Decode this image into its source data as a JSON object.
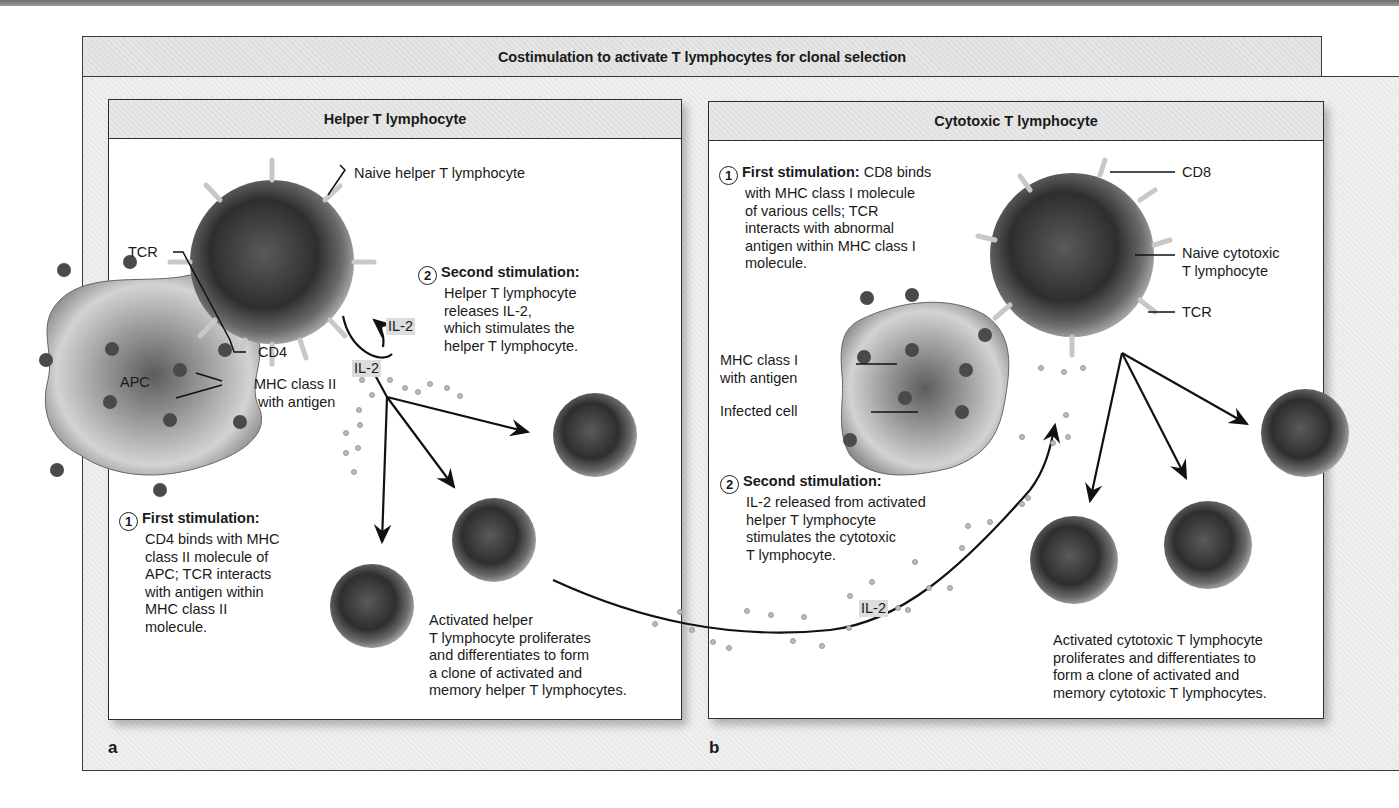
{
  "figure": {
    "title": "Costimulation to activate T lymphocytes for clonal selection",
    "panels": [
      {
        "letter": "a",
        "header": "Helper T lymphocyte",
        "labels": {
          "naive_cell": "Naive helper T lymphocyte",
          "tcr": "TCR",
          "cd4": "CD4",
          "apc": "APC",
          "mhc": [
            "MHC class II",
            "with antigen"
          ],
          "il2_upper": "IL-2",
          "il2_lower": "IL-2"
        },
        "steps": [
          {
            "number": "1",
            "heading": "First stimulation:",
            "lines": [
              "CD4 binds with MHC",
              "class II molecule of",
              "APC; TCR interacts",
              "with antigen within",
              "MHC class II",
              "molecule."
            ]
          },
          {
            "number": "2",
            "heading": "Second stimulation:",
            "lines": [
              "Helper T lymphocyte",
              "releases IL-2,",
              "which stimulates the",
              "helper T lymphocyte."
            ]
          }
        ],
        "result": [
          "Activated helper",
          "T lymphocyte proliferates",
          "and differentiates to form",
          "a clone of activated and",
          "memory helper T lymphocytes."
        ]
      },
      {
        "letter": "b",
        "header": "Cytotoxic T lymphocyte",
        "labels": {
          "cd8": "CD8",
          "naive_cell": [
            "Naive cytotoxic",
            "T lymphocyte"
          ],
          "tcr": "TCR",
          "mhc": [
            "MHC class I",
            "with antigen"
          ],
          "infected_cell": "Infected cell",
          "il2": "IL-2"
        },
        "steps": [
          {
            "number": "1",
            "heading": "First stimulation:",
            "heading_tail": " CD8 binds",
            "lines": [
              "with MHC class I molecule",
              "of various cells; TCR",
              "interacts with abnormal",
              "antigen within MHC class I",
              "molecule."
            ]
          },
          {
            "number": "2",
            "heading": "Second stimulation:",
            "lines": [
              "IL-2 released from activated",
              "helper T lymphocyte",
              "stimulates the cytotoxic",
              "T lymphocyte."
            ]
          }
        ],
        "result": [
          "Activated cytotoxic T lymphocyte",
          "proliferates and differentiates to",
          "form a clone of activated and",
          "memory cytotoxic T lymphocytes."
        ]
      }
    ]
  }
}
